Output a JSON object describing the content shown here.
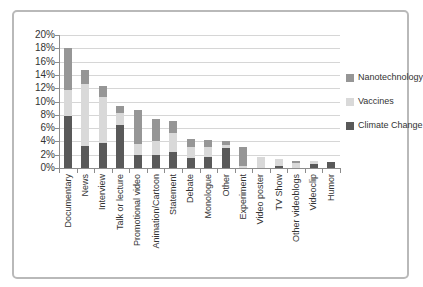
{
  "chart_data": {
    "type": "bar",
    "stacked": true,
    "title": "",
    "xlabel": "",
    "ylabel": "",
    "categories": [
      "Documentary",
      "News",
      "Interview",
      "Talk or lecture",
      "Promotional video",
      "Animation/Cartoon",
      "Statement",
      "Debate",
      "Monologue",
      "Other",
      "Experiment",
      "Video poster",
      "TV Show",
      "Other videoblogs",
      "Videoclip",
      "Humor"
    ],
    "series": [
      {
        "name": "Climate Change",
        "color": "#595959",
        "values": [
          7.8,
          3.3,
          3.7,
          6.5,
          1.9,
          1.9,
          2.4,
          1.5,
          1.7,
          3.0,
          0,
          0,
          0.3,
          0,
          0.6,
          0.9
        ]
      },
      {
        "name": "Vaccines",
        "color": "#d9d9d9",
        "values": [
          3.9,
          9.4,
          7.0,
          1.7,
          1.7,
          2.2,
          2.8,
          1.7,
          1.4,
          0.5,
          0.3,
          1.7,
          1.0,
          0.8,
          0.4,
          0
        ]
      },
      {
        "name": "Nanotechnology",
        "color": "#969696",
        "values": [
          6.3,
          2.0,
          1.7,
          1.1,
          5.1,
          3.3,
          1.8,
          1.2,
          1.1,
          0.5,
          2.9,
          0,
          0,
          0.2,
          0,
          0
        ]
      }
    ],
    "totals": [
      18.0,
      14.7,
      12.4,
      9.3,
      8.7,
      7.4,
      7.0,
      4.4,
      4.2,
      4.0,
      3.2,
      1.7,
      1.3,
      1.0,
      1.0,
      0.9
    ],
    "y_axis": {
      "min": 0,
      "max": 20,
      "step": 2,
      "unit": "%",
      "ticks": [
        "0%",
        "2%",
        "4%",
        "6%",
        "8%",
        "10%",
        "12%",
        "14%",
        "16%",
        "18%",
        "20%"
      ]
    },
    "x_axis": {
      "label_rotation_degrees": 90
    },
    "grid": true,
    "legend": {
      "position": "right",
      "entries": [
        "Nanotechnology",
        "Vaccines",
        "Climate Change"
      ]
    },
    "colors": {
      "climate_change": "#595959",
      "vaccines": "#d9d9d9",
      "nanotechnology": "#969696",
      "gridline": "#d6d6d6",
      "axis": "#8c8c8c",
      "border": "#b9b9b9",
      "text": "#333333"
    }
  }
}
